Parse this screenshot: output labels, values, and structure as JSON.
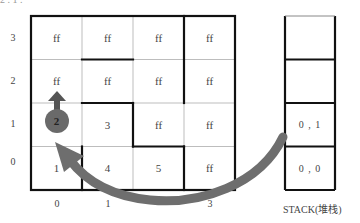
{
  "top_note": "2 . 1 .",
  "grid": {
    "rows": [
      {
        "y_label": "3",
        "cells": [
          "ff",
          "ff",
          "ff",
          "ff"
        ]
      },
      {
        "y_label": "2",
        "cells": [
          "ff",
          "ff",
          "ff",
          "ff"
        ]
      },
      {
        "y_label": "1",
        "cells": [
          "2",
          "3",
          "ff",
          "ff"
        ]
      },
      {
        "y_label": "0",
        "cells": [
          "1",
          "4",
          "5",
          "ff"
        ]
      }
    ],
    "x_labels": [
      "0",
      "1",
      "2",
      "3"
    ],
    "current_cell": {
      "x": 0,
      "y": 1,
      "value": "2"
    }
  },
  "stack": {
    "label": "STACK(堆栈)",
    "cells": [
      "",
      "",
      "0 , 1",
      "0 , 0"
    ]
  },
  "colors": {
    "line_thin": "#bbbbbb",
    "line_thick": "#111111",
    "arrow": "#6e6e6e",
    "circle": "#6a6a6a"
  }
}
